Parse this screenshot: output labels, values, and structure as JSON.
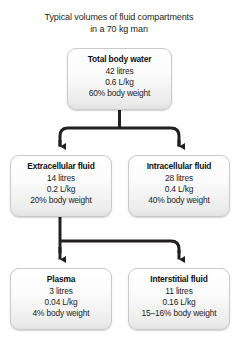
{
  "title": {
    "line1": "Typical volumes of fluid compartments",
    "line2": "in a 70 kg man"
  },
  "colors": {
    "background": "#ffffff",
    "box_border": "#c9c9c9",
    "box_fill_top": "#ffffff",
    "box_fill_bottom": "#e2e2e2",
    "connector": "#231f20",
    "text": "#1a1a1a"
  },
  "nodes": {
    "total_body_water": {
      "title": "Total body water",
      "volume": "42 litres",
      "per_kg": "0.6 L/kg",
      "percent": "60% body weight"
    },
    "extracellular": {
      "title": "Extracellular fluid",
      "volume": "14 litres",
      "per_kg": "0.2 L/kg",
      "percent": "20% body weight"
    },
    "intracellular": {
      "title": "Intracellular fluid",
      "volume": "28 litres",
      "per_kg": "0.4 L/kg",
      "percent": "40% body weight"
    },
    "plasma": {
      "title": "Plasma",
      "volume": "3 litres",
      "per_kg": "0.04 L/kg",
      "percent": "4% body weight"
    },
    "interstitial": {
      "title": "Interstitial fluid",
      "volume": "11 litres",
      "per_kg": "0.16 L/kg",
      "percent": "15–16% body weight"
    }
  }
}
